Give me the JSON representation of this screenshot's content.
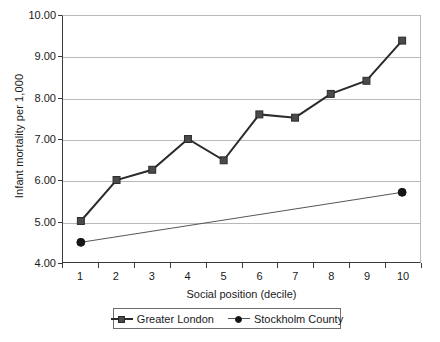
{
  "chart_data": {
    "type": "line",
    "title": "",
    "xlabel": "Social position (decile)",
    "ylabel": "Infant mortality per 1,000",
    "x": [
      1,
      2,
      3,
      4,
      5,
      6,
      7,
      8,
      9,
      10
    ],
    "categories": [
      "1",
      "2",
      "3",
      "4",
      "5",
      "6",
      "7",
      "8",
      "9",
      "10"
    ],
    "ylim": [
      4.0,
      10.0
    ],
    "yticks": [
      4.0,
      5.0,
      6.0,
      7.0,
      8.0,
      9.0,
      10.0
    ],
    "ytick_labels": [
      "4.00",
      "5.00",
      "6.00",
      "7.00",
      "8.00",
      "9.00",
      "10.00"
    ],
    "grid": "horizontal",
    "legend_position": "bottom",
    "series": [
      {
        "name": "Greater London",
        "marker": "square",
        "color": "#2b2b2b",
        "marker_color": "#4a4a4a",
        "values": [
          5.0,
          6.0,
          6.25,
          7.0,
          6.48,
          7.6,
          7.52,
          8.1,
          8.42,
          9.4
        ]
      },
      {
        "name": "Stockholm County",
        "marker": "circle",
        "color": "#555555",
        "marker_color": "#151515",
        "values": [
          4.48,
          null,
          null,
          null,
          null,
          null,
          null,
          null,
          null,
          5.7
        ]
      }
    ]
  },
  "legend": {
    "entries": [
      {
        "label": "Greater London"
      },
      {
        "label": "Stockholm County"
      }
    ]
  }
}
